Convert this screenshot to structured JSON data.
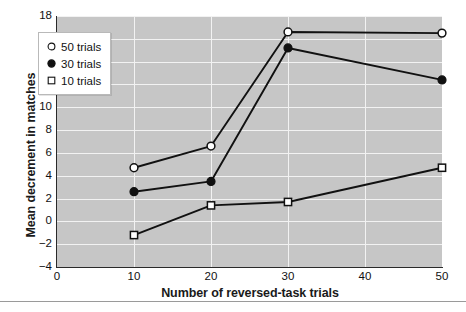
{
  "chart_data": {
    "type": "line",
    "title": "",
    "xlabel": "Number of reversed-task trials",
    "ylabel": "Mean decrement in matches",
    "x": [
      10,
      20,
      30,
      50
    ],
    "xlim": [
      0,
      50
    ],
    "ylim": [
      -4,
      18
    ],
    "xticks": [
      "0",
      "10",
      "20",
      "30",
      "40",
      "50"
    ],
    "xtick_values": [
      0,
      10,
      20,
      30,
      40,
      50
    ],
    "yticks": [
      "18",
      "16",
      "14",
      "12",
      "10",
      "8",
      "6",
      "4",
      "2",
      "0",
      "−2",
      "−4"
    ],
    "ytick_values": [
      18,
      16,
      14,
      12,
      10,
      8,
      6,
      4,
      2,
      0,
      -2,
      -4
    ],
    "grid": true,
    "grid_color": "#f2f2f2",
    "plot_background": "#c6c6c6",
    "legend_position": "upper left",
    "series": [
      {
        "name": "50 trials",
        "marker": "open-circle",
        "values": [
          4.7,
          6.6,
          16.6,
          16.5
        ]
      },
      {
        "name": "30 trials",
        "marker": "filled-circle",
        "values": [
          2.6,
          3.5,
          15.2,
          12.4
        ]
      },
      {
        "name": "10 trials",
        "marker": "open-square",
        "values": [
          -1.2,
          1.4,
          1.7,
          4.7
        ]
      }
    ],
    "line_color": "#111111"
  },
  "legend": {
    "items": [
      {
        "label": "50 trials",
        "marker": "open-circle"
      },
      {
        "label": "30 trials",
        "marker": "filled-circle"
      },
      {
        "label": "10 trials",
        "marker": "open-square"
      }
    ]
  }
}
